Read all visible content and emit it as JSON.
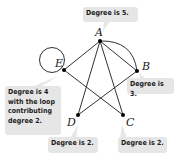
{
  "diagram": {
    "vertices": [
      {
        "id": "A",
        "label": "A",
        "x": 100,
        "y": 41
      },
      {
        "id": "B",
        "label": "B",
        "x": 137,
        "y": 71
      },
      {
        "id": "C",
        "label": "C",
        "x": 123,
        "y": 115
      },
      {
        "id": "D",
        "label": "D",
        "x": 78,
        "y": 115
      },
      {
        "id": "E",
        "label": "E",
        "x": 64,
        "y": 70
      }
    ],
    "edges": [
      {
        "from": "A",
        "to": "B",
        "type": "straight"
      },
      {
        "from": "A",
        "to": "B",
        "type": "arc"
      },
      {
        "from": "A",
        "to": "C",
        "type": "straight"
      },
      {
        "from": "A",
        "to": "D",
        "type": "straight"
      },
      {
        "from": "A",
        "to": "E",
        "type": "straight"
      },
      {
        "from": "B",
        "to": "D",
        "type": "straight"
      },
      {
        "from": "E",
        "to": "C",
        "type": "straight"
      },
      {
        "from": "E",
        "to": "E",
        "type": "loop"
      }
    ],
    "callouts": {
      "A": "Degree is 5.",
      "B": "Degree is 3.",
      "C": "Degree is 2.",
      "D": "Degree is 2.",
      "E": "Degree is 4\nwith the loop\ncontributing\ndegree 2."
    },
    "colors": {
      "edge": "#333333",
      "vertex": "#000000",
      "callout_bg": "#e6e6e6",
      "callout_text": "#1a1a1a"
    }
  }
}
